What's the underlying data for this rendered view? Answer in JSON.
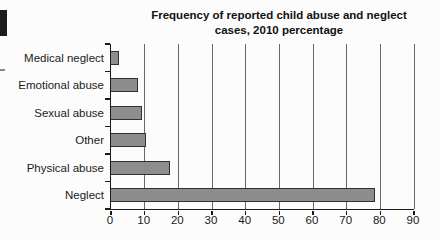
{
  "artifacts": {
    "black_block_color": "#1c1c1c",
    "dash_color": "#8a8a8a"
  },
  "chart_data": {
    "type": "bar",
    "orientation": "horizontal",
    "title": "Frequency of reported child abuse and neglect cases, 2010 percentage",
    "title_lines": [
      "Frequency of reported child abuse and neglect",
      "cases, 2010 percentage"
    ],
    "categories": [
      "Medical neglect",
      "Emotional abuse",
      "Sexual abuse",
      "Other",
      "Physical abuse",
      "Neglect"
    ],
    "values": [
      2.4,
      8.1,
      9.2,
      10.3,
      17.6,
      78.3
    ],
    "xlabel": "",
    "ylabel": "",
    "xlim": [
      0,
      90
    ],
    "xticks": [
      0,
      10,
      20,
      30,
      40,
      50,
      60,
      70,
      80,
      90
    ],
    "xtick_labels": [
      "0",
      "10",
      "20",
      "30",
      "40",
      "50",
      "60",
      "70",
      "80",
      "90"
    ],
    "grid": "vertical",
    "legend": "none",
    "bar_color": "#8d8d8d",
    "bar_border_color": "#303030",
    "grid_color": "#686868",
    "axis_color": "#1a1a1a"
  }
}
